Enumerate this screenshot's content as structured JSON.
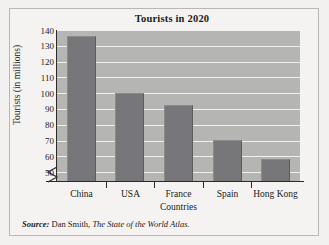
{
  "chart_data": {
    "type": "bar",
    "title": "Tourists in 2020",
    "xlabel": "Countries",
    "ylabel": "Tourists (in millions)",
    "categories": [
      "China",
      "USA",
      "France",
      "Spain",
      "Hong Kong"
    ],
    "values": [
      137,
      101,
      93,
      71,
      59
    ],
    "ylim": [
      45,
      140
    ],
    "yticks": [
      50,
      60,
      70,
      80,
      90,
      100,
      110,
      120,
      130,
      140
    ],
    "grid": true,
    "axis_break": true,
    "legend": "none",
    "colors": {
      "bar": "#77777a",
      "plot_background": "#b5b5b3",
      "gridline": "#efefed",
      "axis": "#2a2a2a",
      "figure_background": "#f4f3f1",
      "text": "#1b1b1b"
    }
  },
  "source": {
    "label": "Source:",
    "author": "Dan Smith,",
    "work": "The State of the World Atlas."
  }
}
